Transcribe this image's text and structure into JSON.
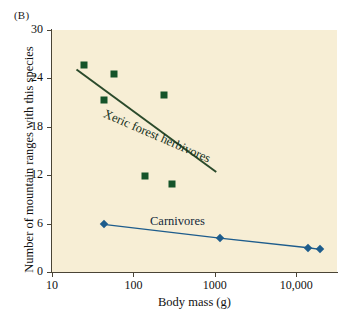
{
  "panel": {
    "label": "(B)"
  },
  "chart_data": {
    "type": "scatter",
    "title": "",
    "xlabel": "Body mass (g)",
    "ylabel": "Number of mountain ranges with this species",
    "xscale": "log",
    "yscale": "linear",
    "xlim": [
      10,
      31623
    ],
    "ylim": [
      0,
      30
    ],
    "grid": false,
    "legend_position": "inline-annotation",
    "x_ticks": [
      {
        "value": 10,
        "label": "10"
      },
      {
        "value": 100,
        "label": "100"
      },
      {
        "value": 1000,
        "label": "1000"
      },
      {
        "value": 10000,
        "label": "10,000"
      }
    ],
    "y_ticks": [
      {
        "value": 0,
        "label": "0"
      },
      {
        "value": 6,
        "label": "6"
      },
      {
        "value": 12,
        "label": "12"
      },
      {
        "value": 18,
        "label": "18"
      },
      {
        "value": 24,
        "label": "24"
      },
      {
        "value": 30,
        "label": "30"
      }
    ],
    "series": [
      {
        "name": "Xeric forest herbivores",
        "marker": "square",
        "color": "#15542a",
        "connected": false,
        "trendline": {
          "x": [
            20,
            1040
          ],
          "y": [
            25.1,
            12.4
          ],
          "color": "#2b4a2b"
        },
        "points": [
          {
            "x": 25,
            "y": 25.7
          },
          {
            "x": 58,
            "y": 24.6
          },
          {
            "x": 43,
            "y": 21.3
          },
          {
            "x": 235,
            "y": 21.9
          },
          {
            "x": 140,
            "y": 11.9
          },
          {
            "x": 300,
            "y": 10.9
          }
        ]
      },
      {
        "name": "Carnivores",
        "marker": "diamond",
        "color": "#1d5c8c",
        "connected": true,
        "points": [
          {
            "x": 43,
            "y": 5.9
          },
          {
            "x": 1150,
            "y": 4.2
          },
          {
            "x": 14000,
            "y": 3.0
          },
          {
            "x": 19500,
            "y": 2.8
          }
        ]
      }
    ],
    "annotations": [
      {
        "text": "Xeric forest herbivores",
        "rotation": -23.5
      },
      {
        "text": "Carnivores",
        "rotation": 0
      }
    ],
    "colors": {
      "plot_background": "#f7eed5",
      "page_background": "#ffffff",
      "axis": "#4a4436",
      "herbivore": "#15542a",
      "carnivore": "#1d5c8c"
    }
  }
}
